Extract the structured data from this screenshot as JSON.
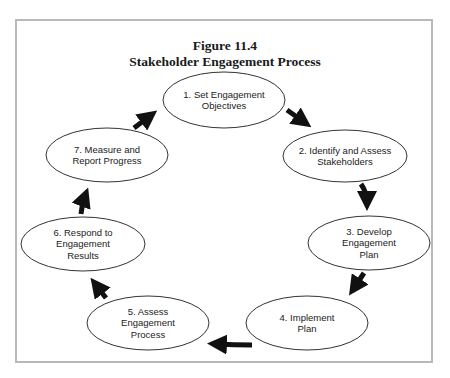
{
  "figure": {
    "number_label": "Figure 11.4",
    "title": "Stakeholder Engagement Process"
  },
  "colors": {
    "frame_border": "#b8b8b8",
    "node_stroke": "#333333",
    "node_fill": "#ffffff",
    "arrow": "#111111",
    "text": "#222222"
  },
  "nodes": [
    {
      "id": 1,
      "line1": "1. Set Engagement",
      "line2": "Objectives",
      "line3": "",
      "cx": 224,
      "cy": 100,
      "rx": 61,
      "ry": 28
    },
    {
      "id": 2,
      "line1": "2. Identify and Assess",
      "line2": "Stakeholders",
      "line3": "",
      "cx": 345,
      "cy": 156,
      "rx": 62,
      "ry": 26
    },
    {
      "id": 3,
      "line1": "3. Develop",
      "line2": "Engagement",
      "line3": "Plan",
      "cx": 369,
      "cy": 243,
      "rx": 61,
      "ry": 27
    },
    {
      "id": 4,
      "line1": "4. Implement",
      "line2": "Plan",
      "line3": "",
      "cx": 307,
      "cy": 323,
      "rx": 61,
      "ry": 27
    },
    {
      "id": 5,
      "line1": "5. Assess",
      "line2": "Engagement",
      "line3": "Process",
      "cx": 148,
      "cy": 323,
      "rx": 61,
      "ry": 27
    },
    {
      "id": 6,
      "line1": "6. Respond to",
      "line2": "Engagement",
      "line3": "Results",
      "cx": 83,
      "cy": 244,
      "rx": 62,
      "ry": 27
    },
    {
      "id": 7,
      "line1": "7. Measure and",
      "line2": "Report Progress",
      "line3": "",
      "cx": 107,
      "cy": 155,
      "rx": 61,
      "ry": 27
    }
  ],
  "edges": [
    {
      "from": 1,
      "to": 2
    },
    {
      "from": 2,
      "to": 3
    },
    {
      "from": 3,
      "to": 4
    },
    {
      "from": 4,
      "to": 5
    },
    {
      "from": 5,
      "to": 6
    },
    {
      "from": 6,
      "to": 7
    },
    {
      "from": 7,
      "to": 1
    }
  ]
}
